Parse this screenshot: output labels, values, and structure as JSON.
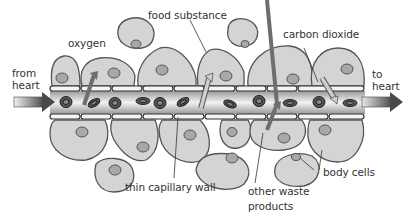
{
  "diagram": {
    "labels": {
      "from_heart_1": "from",
      "from_heart_2": "heart",
      "to_heart_1": "to",
      "to_heart_2": "heart",
      "oxygen": "oxygen",
      "food_substance": "food substance",
      "carbon_dioxide": "carbon dioxide",
      "thin_capillary_wall": "thin capillary wall",
      "other_waste_1": "other waste",
      "other_waste_2": "products",
      "body_cells": "body cells"
    },
    "colors": {
      "cell_fill": "#d4d4d4",
      "cell_stroke": "#555555",
      "nucleus_fill": "#a8a8a8",
      "rbc_fill": "#555555",
      "arrow_dark": "#6e6e6e",
      "arrow_light": "#cfcfcf",
      "wall_fill": "#f4f4f4"
    }
  }
}
